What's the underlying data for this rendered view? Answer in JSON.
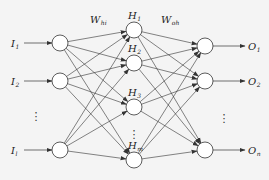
{
  "diagram": {
    "colors": {
      "stroke": "#333333",
      "node_fill": "#ffffff",
      "background": "#f4f4f4"
    },
    "input_layer": {
      "nodes": [
        {
          "id": "I1",
          "label": "I",
          "sub": "1",
          "x": 60,
          "y": 43
        },
        {
          "id": "I2",
          "label": "I",
          "sub": "2",
          "x": 60,
          "y": 81
        },
        {
          "id": "Il",
          "label": "I",
          "sub": "l",
          "x": 60,
          "y": 150
        }
      ],
      "ellipsis": "⋮"
    },
    "hidden_layer": {
      "nodes": [
        {
          "id": "H1",
          "label": "H",
          "sub": "1",
          "x": 134,
          "y": 30
        },
        {
          "id": "H2",
          "label": "H",
          "sub": "2",
          "x": 134,
          "y": 63
        },
        {
          "id": "H3",
          "label": "H",
          "sub": "3",
          "x": 134,
          "y": 107
        },
        {
          "id": "Hm",
          "label": "H",
          "sub": "m",
          "x": 134,
          "y": 160
        }
      ],
      "ellipsis": "⋮"
    },
    "output_layer": {
      "nodes": [
        {
          "id": "O1",
          "label": "O",
          "sub": "1",
          "x": 205,
          "y": 46
        },
        {
          "id": "O2",
          "label": "O",
          "sub": "2",
          "x": 205,
          "y": 81
        },
        {
          "id": "On",
          "label": "O",
          "sub": "n",
          "x": 205,
          "y": 150
        }
      ],
      "ellipsis": "⋮"
    },
    "weights": {
      "input_hidden": {
        "label": "W",
        "sub": "hi"
      },
      "hidden_output": {
        "label": "W",
        "sub": "oh"
      }
    },
    "node_radius": 8
  }
}
